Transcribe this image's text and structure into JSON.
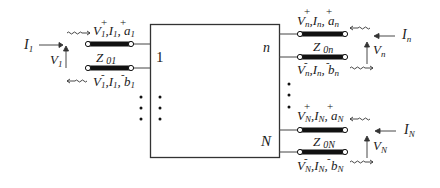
{
  "diagram": {
    "network_box": {
      "port_labels": {
        "first": "1",
        "middle": "n",
        "last": "N"
      }
    },
    "ports": [
      {
        "id": "port-1",
        "side": "left",
        "external_current": "I",
        "external_current_sub": "1",
        "external_voltage": "V",
        "external_voltage_sub": "1",
        "incident": {
          "V": "V",
          "I": "I",
          "w": "a",
          "sub": "1",
          "sign": "+"
        },
        "reflected": {
          "V": "V",
          "I": "I",
          "w": "b",
          "sub": "1",
          "sign": "-"
        },
        "impedance": {
          "name": "Z",
          "sub": "01"
        }
      },
      {
        "id": "port-n",
        "side": "right",
        "external_current": "I",
        "external_current_sub": "n",
        "external_voltage": "V",
        "external_voltage_sub": "n",
        "incident": {
          "V": "V",
          "I": "I",
          "w": "a",
          "sub": "n",
          "sign": "+"
        },
        "reflected": {
          "V": "V",
          "I": "I",
          "w": "b",
          "sub": "n",
          "sign": "-"
        },
        "impedance": {
          "name": "Z",
          "sub": "0n"
        }
      },
      {
        "id": "port-N",
        "side": "right",
        "external_current": "I",
        "external_current_sub": "N",
        "external_voltage": "V",
        "external_voltage_sub": "N",
        "incident": {
          "V": "V",
          "I": "I",
          "w": "a",
          "sub": "N",
          "sign": "+"
        },
        "reflected": {
          "V": "V",
          "I": "I",
          "w": "b",
          "sub": "N",
          "sign": "-"
        },
        "impedance": {
          "name": "Z",
          "sub": "0N"
        }
      }
    ],
    "ellipsis": "⋮",
    "colors": {
      "line": "#2a2a2a",
      "tline": "#111111",
      "box": "#333333"
    }
  }
}
